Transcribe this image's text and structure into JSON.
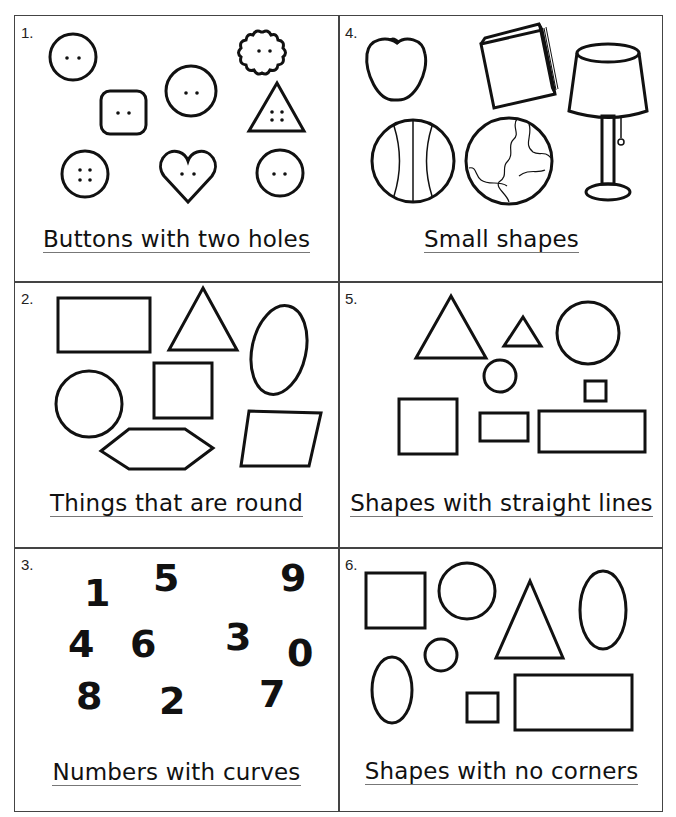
{
  "worksheet": {
    "cells": [
      {
        "number": "1.",
        "label": "Buttons with two holes",
        "items": [
          "round button (2 holes)",
          "square button (2 holes)",
          "round button (2 holes)",
          "flower button (2 holes)",
          "triangle button (4 holes)",
          "round button (4 holes)",
          "heart button (2 holes)",
          "round button (2 holes)"
        ]
      },
      {
        "number": "2.",
        "label": "Things that are round",
        "items": [
          "rectangle",
          "triangle",
          "oval",
          "circle",
          "square",
          "hexagon",
          "parallelogram"
        ]
      },
      {
        "number": "3.",
        "label": "Numbers with curves",
        "digits": [
          "1",
          "5",
          "9",
          "4",
          "6",
          "3",
          "0",
          "8",
          "2",
          "7"
        ]
      },
      {
        "number": "4.",
        "label": "Small shapes",
        "items": [
          "apple",
          "book",
          "lamp",
          "ball",
          "globe"
        ]
      },
      {
        "number": "5.",
        "label": "Shapes with straight lines",
        "items": [
          "large triangle",
          "small triangle",
          "large circle",
          "small circle",
          "small square",
          "square",
          "small rectangle",
          "large rectangle"
        ]
      },
      {
        "number": "6.",
        "label": "Shapes with no corners",
        "items": [
          "square",
          "circle",
          "triangle",
          "oval",
          "small circle",
          "oval",
          "small square",
          "rectangle"
        ]
      }
    ],
    "colors": {
      "ink": "#111111",
      "border": "#444444",
      "underline": "#777777"
    }
  }
}
